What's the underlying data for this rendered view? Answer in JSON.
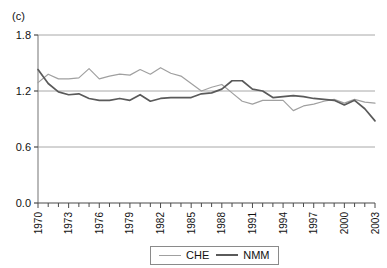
{
  "panel": {
    "label": "(c)"
  },
  "legend": {
    "position": "bottom-center",
    "items": [
      {
        "name": "CHE",
        "color": "#a0a0a0"
      },
      {
        "name": "NMM",
        "color": "#5a5a5a"
      }
    ]
  },
  "axes": {
    "y_ticks": [
      "0.0",
      "0.6",
      "1.2",
      "1.8"
    ],
    "x_ticks": [
      "1970",
      "1973",
      "1976",
      "1979",
      "1982",
      "1985",
      "1988",
      "1991",
      "1994",
      "1997",
      "2000",
      "2003"
    ]
  },
  "chart_data": {
    "type": "line",
    "title": "(c)",
    "xlabel": "",
    "ylabel": "",
    "xlim": [
      1970,
      2003
    ],
    "ylim": [
      0.0,
      1.8
    ],
    "ytick_values": [
      0.0,
      0.6,
      1.2,
      1.8
    ],
    "xtick_values": [
      1970,
      1973,
      1976,
      1979,
      1982,
      1985,
      1988,
      1991,
      1994,
      1997,
      2000,
      2003
    ],
    "grid": "horizontal",
    "minor_xticks": "every 1 year",
    "legend_position": "bottom-center",
    "x": [
      1970,
      1971,
      1972,
      1973,
      1974,
      1975,
      1976,
      1977,
      1978,
      1979,
      1980,
      1981,
      1982,
      1983,
      1984,
      1985,
      1986,
      1987,
      1988,
      1989,
      1990,
      1991,
      1992,
      1993,
      1994,
      1995,
      1996,
      1997,
      1998,
      1999,
      2000,
      2001,
      2002,
      2003
    ],
    "series": [
      {
        "name": "CHE",
        "color": "#a0a0a0",
        "values": [
          1.29,
          1.38,
          1.33,
          1.33,
          1.34,
          1.44,
          1.33,
          1.36,
          1.38,
          1.37,
          1.43,
          1.38,
          1.45,
          1.39,
          1.36,
          1.28,
          1.2,
          1.24,
          1.27,
          1.18,
          1.09,
          1.06,
          1.1,
          1.1,
          1.1,
          0.99,
          1.04,
          1.06,
          1.09,
          1.11,
          1.07,
          1.11,
          1.08,
          1.07
        ]
      },
      {
        "name": "NMM",
        "color": "#5a5a5a",
        "values": [
          1.43,
          1.28,
          1.19,
          1.16,
          1.17,
          1.12,
          1.1,
          1.1,
          1.12,
          1.1,
          1.16,
          1.09,
          1.12,
          1.13,
          1.13,
          1.13,
          1.17,
          1.18,
          1.22,
          1.31,
          1.31,
          1.22,
          1.2,
          1.13,
          1.14,
          1.15,
          1.14,
          1.12,
          1.11,
          1.1,
          1.05,
          1.1,
          1.01,
          0.88
        ]
      }
    ]
  }
}
